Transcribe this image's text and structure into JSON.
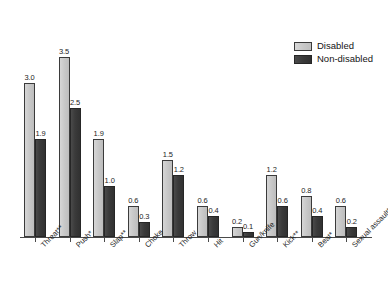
{
  "chart_data": {
    "type": "bar",
    "title": "",
    "subtitle": "",
    "xlabel": "",
    "ylabel": "",
    "ylim": [
      0,
      3.8
    ],
    "grid": false,
    "legend_position": "top-right",
    "categories": [
      "Threat**",
      "Push*",
      "Slap**",
      "Choke",
      "Throw",
      "Hit",
      "Gun/knife",
      "Kick**",
      "Beat*",
      "Sexual assault**"
    ],
    "series": [
      {
        "name": "Disabled",
        "color": "#c9c9c9",
        "values": [
          3.0,
          3.5,
          1.9,
          0.6,
          1.5,
          0.6,
          0.2,
          1.2,
          0.8,
          0.6
        ],
        "labels": [
          "3.0",
          "3.5",
          "1.9",
          "0.6",
          "1.5",
          "0.6",
          "0.2",
          "1.2",
          "0.8",
          "0.6"
        ]
      },
      {
        "name": "Non-disabled",
        "color": "#3a3a3a",
        "values": [
          1.9,
          2.5,
          1.0,
          0.3,
          1.2,
          0.4,
          0.1,
          0.6,
          0.4,
          0.2
        ],
        "labels": [
          "1.9",
          "2.5",
          "1.0",
          "0.3",
          "1.2",
          "0.4",
          "0.1",
          "0.6",
          "0.4",
          "0.2"
        ]
      }
    ]
  },
  "legend": {
    "items": [
      {
        "label": "Disabled"
      },
      {
        "label": "Non-disabled"
      }
    ]
  }
}
